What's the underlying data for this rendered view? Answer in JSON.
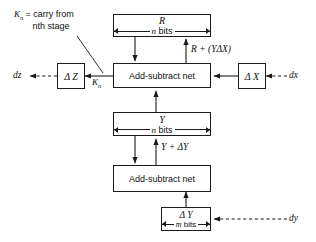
{
  "diagram": {
    "annotation": {
      "line1_symbol": "K",
      "line1_subscript": "n",
      "line1_text": "= carry from",
      "line2_text": "nth stage"
    },
    "boxes": {
      "r_register": {
        "name": "R",
        "bits": "n bits"
      },
      "y_register": {
        "name": "Y",
        "bits": "n bits"
      },
      "adder_top": {
        "label": "Add-subtract net"
      },
      "adder_bottom": {
        "label": "Add-subtract net"
      },
      "delta_z": {
        "label": "Δ Z"
      },
      "delta_x": {
        "label": "Δ X"
      },
      "delta_y": {
        "label": "Δ Y",
        "bits": "m bits"
      }
    },
    "signals": {
      "dz": "dz",
      "dx": "dx",
      "dy": "dy",
      "carry_out": "K",
      "carry_out_sub": "n",
      "r_plus_ydx": "R + (YΔX)",
      "y_plus_dy": "Y + ΔY"
    },
    "colors": {
      "ink": "#101010",
      "line": "#1a1a1a",
      "paper": "#ffffff"
    }
  }
}
